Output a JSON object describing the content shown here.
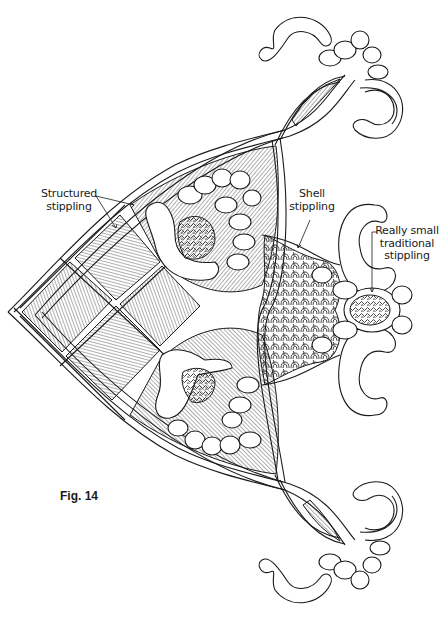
{
  "figure": {
    "caption": "Fig. 14",
    "colors": {
      "ink": "#1a1a1a",
      "background": "#ffffff"
    }
  },
  "labels": {
    "structured": {
      "line1": "Structured",
      "line2": "stippling"
    },
    "shell": {
      "line1": "Shell",
      "line2": "stippling"
    },
    "traditional": {
      "line1": "Really small",
      "line2": "traditional",
      "line3": "stippling"
    }
  }
}
